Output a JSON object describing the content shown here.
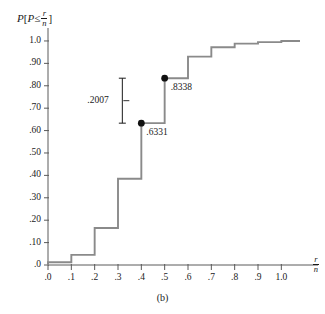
{
  "figure": {
    "caption": "(b)",
    "yaxis_title_lead": "P",
    "yaxis_title_open": "[",
    "yaxis_title_var": "P",
    "yaxis_title_rel": "≤",
    "yaxis_title_close": "]",
    "num": "r",
    "den": "n",
    "xaxis_title_num": "r",
    "xaxis_title_den": "n",
    "line_color": "#8a8a8a",
    "point_color": "#111111",
    "axis_color": "#5a5a5a"
  },
  "annotations": {
    "lower_point_label": ".6331",
    "upper_point_label": ".8338",
    "difference_label": ".2007",
    "lower_point_value": 0.6331,
    "upper_point_value": 0.8338,
    "difference_value": 0.2007,
    "lower_point_x": 0.4,
    "upper_point_x": 0.5
  },
  "chart_data": {
    "type": "line",
    "title": "",
    "xlabel": "r/n",
    "ylabel": "P [P ≤ r/n]",
    "xlim": [
      0.0,
      1.08
    ],
    "ylim": [
      0.0,
      1.04
    ],
    "grid": false,
    "legend": "none",
    "step_style": "post",
    "xticks": [
      0.0,
      0.1,
      0.2,
      0.3,
      0.4,
      0.5,
      0.6,
      0.7,
      0.8,
      0.9,
      1.0
    ],
    "xtick_labels": [
      ".0",
      ".1",
      ".2",
      ".3",
      ".4",
      ".5",
      ".6",
      ".7",
      ".8",
      ".9",
      "1.0"
    ],
    "yticks": [
      0.0,
      0.1,
      0.2,
      0.3,
      0.4,
      0.5,
      0.6,
      0.7,
      0.8,
      0.9,
      1.0
    ],
    "ytick_labels": [
      ".0",
      ".10",
      ".20",
      ".30",
      ".40",
      ".50",
      ".60",
      ".70",
      ".80",
      ".90",
      "1.0"
    ],
    "x": [
      0.0,
      0.1,
      0.2,
      0.3,
      0.4,
      0.5,
      0.6,
      0.7,
      0.8,
      0.9,
      1.0
    ],
    "values": [
      0.012,
      0.045,
      0.165,
      0.385,
      0.6331,
      0.8338,
      0.93,
      0.972,
      0.988,
      0.995,
      1.0
    ],
    "series": [
      {
        "name": "cumulative probability",
        "values": [
          0.012,
          0.045,
          0.165,
          0.385,
          0.6331,
          0.8338,
          0.93,
          0.972,
          0.988,
          0.995,
          1.0
        ]
      }
    ],
    "marked_points": [
      {
        "x": 0.4,
        "y": 0.6331,
        "label": ".6331"
      },
      {
        "x": 0.5,
        "y": 0.8338,
        "label": ".8338"
      }
    ]
  }
}
